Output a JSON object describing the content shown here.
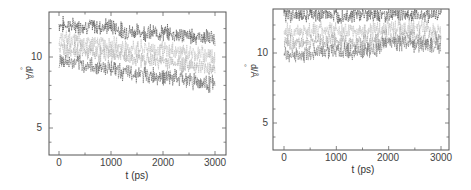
{
  "chart_data": [
    {
      "type": "line",
      "title": "",
      "xlabel": "t (ps)",
      "ylabel": "d/Å",
      "xlim": [
        -200,
        3200
      ],
      "ylim": [
        3,
        12.9
      ],
      "xticks": [
        0,
        1000,
        2000,
        3000
      ],
      "yticks_labeled": [
        5,
        10
      ],
      "grid": false,
      "legend": null,
      "x": [
        0,
        250,
        500,
        750,
        1000,
        1250,
        1500,
        1750,
        2000,
        2250,
        2500,
        2750,
        3000
      ],
      "series": [
        {
          "name": "trace-1 (dark, top)",
          "color": "#444444",
          "values": [
            12.3,
            12.2,
            12.2,
            12.1,
            12.2,
            11.8,
            11.8,
            11.7,
            11.7,
            11.6,
            11.5,
            11.4,
            11.3
          ]
        },
        {
          "name": "trace-2 (light)",
          "color": "#bbbbbb",
          "values": [
            11.3,
            11.2,
            11.0,
            10.9,
            10.9,
            10.7,
            10.6,
            10.6,
            10.5,
            10.4,
            10.3,
            10.2,
            10.1
          ]
        },
        {
          "name": "trace-3 (light)",
          "color": "#aaaaaa",
          "values": [
            10.6,
            10.5,
            10.4,
            10.2,
            10.2,
            10.0,
            9.9,
            9.8,
            9.7,
            9.6,
            9.5,
            9.3,
            9.2
          ]
        },
        {
          "name": "trace-4 (dark, bottom)",
          "color": "#555555",
          "values": [
            9.7,
            9.6,
            9.4,
            9.3,
            9.3,
            8.9,
            8.8,
            8.7,
            8.6,
            8.5,
            8.4,
            8.2,
            8.1
          ]
        }
      ]
    },
    {
      "type": "line",
      "title": "",
      "xlabel": "t (ps)",
      "ylabel": "d/Å",
      "xlim": [
        -200,
        3200
      ],
      "ylim": [
        3,
        13
      ],
      "xticks": [
        0,
        1000,
        2000,
        3000
      ],
      "yticks_labeled": [
        5,
        10
      ],
      "grid": false,
      "legend": null,
      "x": [
        0,
        250,
        500,
        750,
        1000,
        1250,
        1500,
        1750,
        2000,
        2250,
        2500,
        2750,
        3000
      ],
      "series": [
        {
          "name": "trace-1 (dark, top)",
          "color": "#444444",
          "values": [
            12.8,
            12.7,
            12.7,
            12.8,
            12.7,
            12.7,
            12.8,
            12.7,
            12.8,
            12.8,
            12.7,
            12.8,
            12.8
          ]
        },
        {
          "name": "trace-2 (light)",
          "color": "#bbbbbb",
          "values": [
            11.6,
            11.5,
            11.6,
            11.7,
            11.6,
            11.5,
            11.6,
            11.6,
            11.9,
            11.8,
            11.8,
            11.8,
            11.7
          ]
        },
        {
          "name": "trace-3 (light)",
          "color": "#999999",
          "values": [
            10.8,
            10.7,
            10.8,
            10.9,
            10.8,
            10.7,
            10.8,
            10.8,
            11.2,
            11.2,
            11.1,
            11.1,
            11.0
          ]
        },
        {
          "name": "trace-4 (dark, bottom)",
          "color": "#666666",
          "values": [
            9.9,
            9.8,
            10.0,
            10.2,
            10.2,
            10.1,
            10.1,
            10.2,
            10.7,
            10.7,
            10.6,
            10.6,
            10.5
          ]
        }
      ]
    }
  ],
  "panels": {
    "left": {
      "xtick_labels": [
        "0",
        "1000",
        "2000",
        "3000"
      ],
      "ytick_labels": [
        "10",
        "5"
      ],
      "xlabel": "t (ps)",
      "ylabel": "d/Å"
    },
    "right": {
      "xtick_labels": [
        "0",
        "1000",
        "2000",
        "3000"
      ],
      "ytick_labels": [
        "10",
        "5"
      ],
      "xlabel": "t (ps)",
      "ylabel": "d/Å"
    }
  }
}
